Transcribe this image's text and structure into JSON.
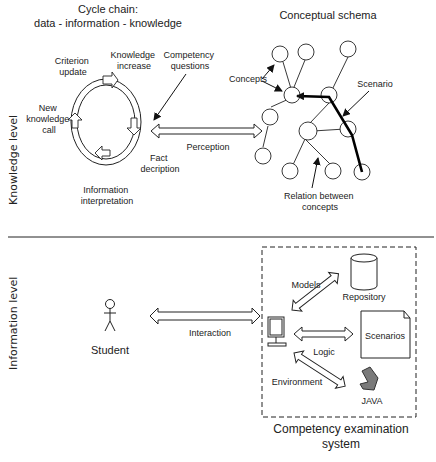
{
  "knowledge_level": {
    "side_label": "Knowledge level",
    "cycle": {
      "title_line1": "Cycle chain:",
      "title_line2": "data - information - knowledge",
      "steps": {
        "criterion_update": [
          "Criterion",
          "update"
        ],
        "knowledge_increase": [
          "Knowledge",
          "increase"
        ],
        "new_knowledge_call": [
          "New",
          "knowledge",
          "call"
        ],
        "information_interpretation": [
          "Information",
          "interpretation"
        ],
        "fact_description": [
          "Fact",
          "decription"
        ]
      }
    },
    "competency_questions": [
      "Competency",
      "questions"
    ],
    "perception_label": "Perception",
    "schema": {
      "title": "Conceptual schema",
      "concepts_label": "Concepts",
      "scenario_label": "Scenario",
      "relation_label": [
        "Relation between",
        "concepts"
      ]
    }
  },
  "information_level": {
    "side_label": "Information level",
    "student_label": "Student",
    "interaction_label": "Interaction",
    "system": {
      "models_label": "Models",
      "repository_label": "Repository",
      "scenarios_label": "Scenarios",
      "logic_label": "Logic",
      "environment_label": "Environment",
      "java_label": "JAVA",
      "caption_line1": "Competency examination",
      "caption_line2": "system"
    }
  }
}
